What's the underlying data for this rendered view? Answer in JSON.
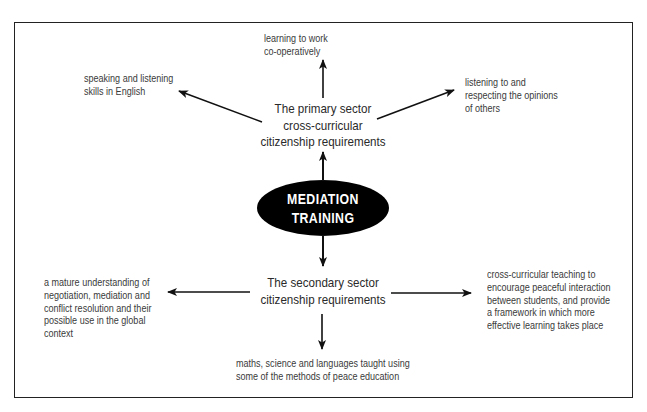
{
  "diagram": {
    "center": {
      "line1": "MEDIATION",
      "line2": "TRAINING",
      "fill": "#000000",
      "text_color": "#ffffff"
    },
    "primary_hub": {
      "line1": "The primary sector",
      "line2": "cross-curricular",
      "line3": "citizenship requirements"
    },
    "secondary_hub": {
      "line1": "The secondary sector",
      "line2": "citizenship requirements"
    },
    "primary_outcomes": {
      "top": [
        "learning to work",
        "co-operatively"
      ],
      "left": [
        "speaking and listening",
        "skills in English"
      ],
      "right": [
        "listening to and",
        "respecting the opinions",
        "of others"
      ]
    },
    "secondary_outcomes": {
      "left": [
        "a mature understanding of",
        "negotiation, mediation and",
        "conflict resolution and their",
        "possible use in the global",
        "context"
      ],
      "right": [
        "cross-curricular teaching to",
        "encourage peaceful interaction",
        "between students, and provide",
        "a framework in which more",
        "effective learning takes place"
      ],
      "bottom": [
        "maths, science and languages taught using",
        "some of the methods of peace education"
      ]
    }
  }
}
